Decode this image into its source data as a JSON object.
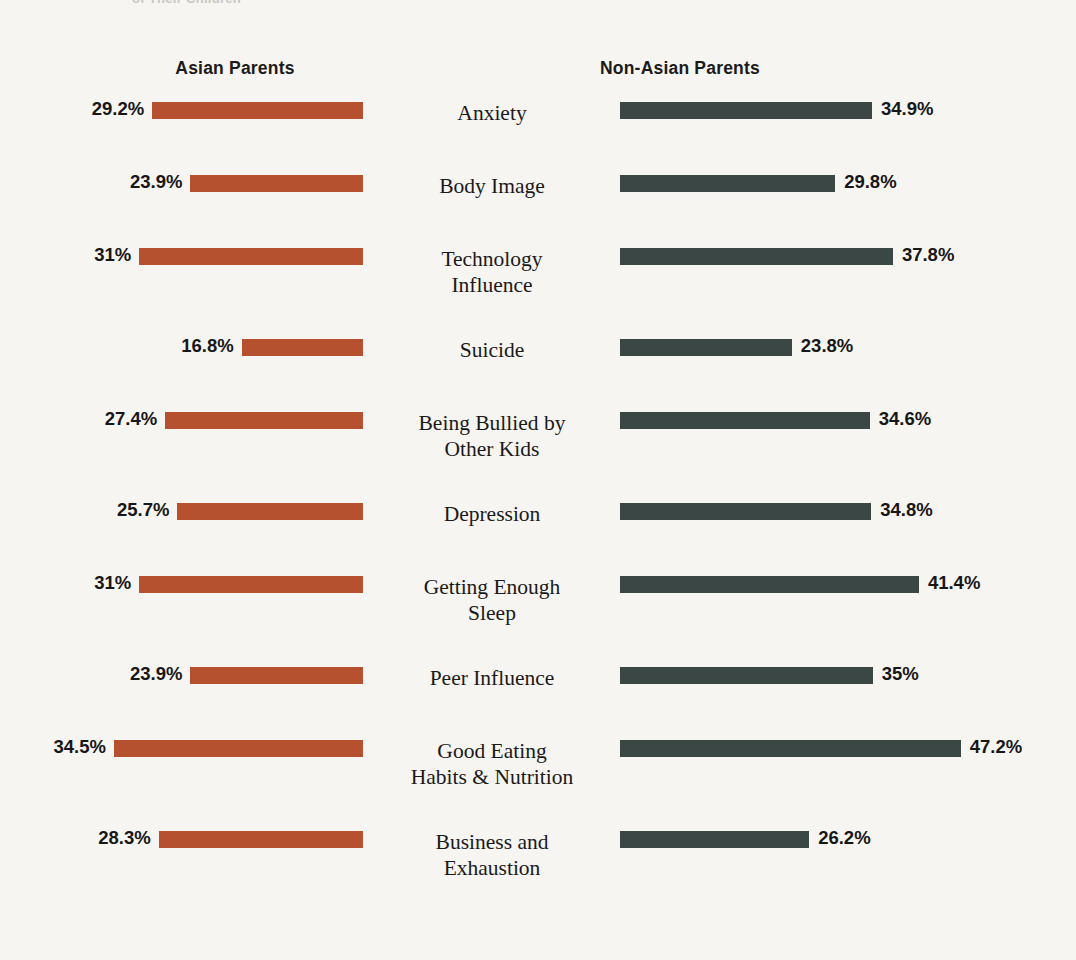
{
  "top_clipped_title": "of Their Children",
  "headers": {
    "left": "Asian Parents",
    "right": "Non-Asian Parents"
  },
  "colors": {
    "background": "#f7f5f2",
    "asian_bar": "#b5512e",
    "non_asian_bar": "#3a4744",
    "text": "#171717"
  },
  "chart_data": {
    "type": "bar",
    "title": "",
    "xlabel": "",
    "ylabel": "",
    "orientation": "horizontal-diverging",
    "grid": false,
    "legend_position": "top",
    "unit": "%",
    "xlim": [
      0,
      50
    ],
    "categories": [
      "Anxiety",
      "Body Image",
      "Technology Influence",
      "Suicide",
      "Being Bullied by Other Kids",
      "Depression",
      "Getting Enough Sleep",
      "Peer Influence",
      "Good Eating Habits & Nutrition",
      "Business and Exhaustion"
    ],
    "category_lines": [
      [
        "Anxiety"
      ],
      [
        "Body Image"
      ],
      [
        "Technology",
        "Influence"
      ],
      [
        "Suicide"
      ],
      [
        "Being Bullied by",
        "Other Kids"
      ],
      [
        "Depression"
      ],
      [
        "Getting Enough",
        "Sleep"
      ],
      [
        "Peer Influence"
      ],
      [
        "Good Eating",
        "Habits & Nutrition"
      ],
      [
        "Business and",
        "Exhaustion"
      ]
    ],
    "series": [
      {
        "name": "Asian Parents",
        "color": "#b5512e",
        "values": [
          29.2,
          23.9,
          31,
          16.8,
          27.4,
          25.7,
          31,
          23.9,
          34.5,
          28.3
        ],
        "labels": [
          "29.2%",
          "23.9%",
          "31%",
          "16.8%",
          "27.4%",
          "25.7%",
          "31%",
          "23.9%",
          "34.5%",
          "28.3%"
        ]
      },
      {
        "name": "Non-Asian Parents",
        "color": "#3a4744",
        "values": [
          34.9,
          29.8,
          37.8,
          23.8,
          34.6,
          34.8,
          41.4,
          35,
          47.2,
          26.2
        ],
        "labels": [
          "34.9%",
          "29.8%",
          "37.8%",
          "23.8%",
          "34.6%",
          "34.8%",
          "41.4%",
          "35%",
          "47.2%",
          "26.2%"
        ]
      }
    ]
  }
}
